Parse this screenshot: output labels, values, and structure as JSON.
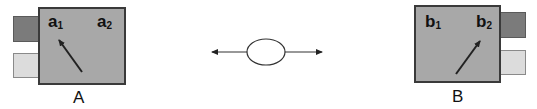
{
  "diagram": {
    "node_a": {
      "label": "A",
      "ports": [
        {
          "name": "a",
          "sub": "1"
        },
        {
          "name": "a",
          "sub": "2"
        }
      ],
      "arrow_target": "a1"
    },
    "node_b": {
      "label": "B",
      "ports": [
        {
          "name": "b",
          "sub": "1"
        },
        {
          "name": "b",
          "sub": "2"
        }
      ],
      "arrow_target": "b2"
    },
    "link": {
      "shape": "ellipse",
      "direction": "bidirectional"
    },
    "colors": {
      "box_fill": "#a8a8a8",
      "box_border": "#3a3a3a",
      "tab_dark": "#7b7b7b",
      "tab_light": "#dcdcdc",
      "line": "#222222"
    }
  }
}
